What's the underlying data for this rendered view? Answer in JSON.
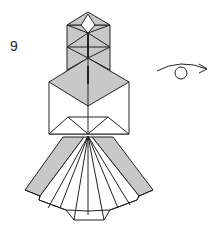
{
  "diagram": {
    "step_number": "9",
    "symbol": "turn-over",
    "colors": {
      "shade": "#c8c8c8",
      "line": "#222222",
      "paper": "#ffffff"
    }
  }
}
